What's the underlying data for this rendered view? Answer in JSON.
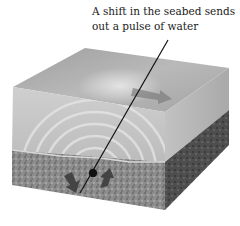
{
  "diagram": {
    "caption_lines": [
      "A shift in the seabed sends",
      "out a pulse of water"
    ],
    "colors": {
      "background": "#ffffff",
      "water_top": "#a8a8a8",
      "water_front": "#c9c9c9",
      "water_side": "#b4b4b4",
      "seabed_front": "#8a8a8a",
      "seabed_side": "#4e4e4e",
      "arrow": "#444444",
      "leader_line": "#111111",
      "text": "#1a1a1a"
    },
    "elements": {
      "water_block": "ocean water volume",
      "seabed_layer": "rocky seabed",
      "fault_point": "fault / epicentre marker",
      "arrow_down": "seabed drops",
      "arrow_up": "seabed rises",
      "wave_arrow": "pulse travelling across surface",
      "ripples": "concentric pressure waves"
    }
  }
}
